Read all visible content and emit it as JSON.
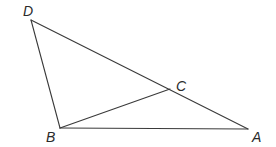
{
  "diagram": {
    "type": "geometry-triangle",
    "stroke_color": "#3a3a3a",
    "label_color": "#2a2a2a",
    "points": {
      "D": {
        "x": 31,
        "y": 20,
        "label": "D",
        "label_x": 23,
        "label_y": 16
      },
      "B": {
        "x": 60,
        "y": 128,
        "label": "B",
        "label_x": 46,
        "label_y": 142
      },
      "C": {
        "x": 170,
        "y": 89,
        "label": "C",
        "label_x": 176,
        "label_y": 91
      },
      "A": {
        "x": 248,
        "y": 129,
        "label": "A",
        "label_x": 252,
        "label_y": 142
      }
    },
    "segments": [
      {
        "from": "D",
        "to": "A",
        "name": "segment-da"
      },
      {
        "from": "D",
        "to": "B",
        "name": "segment-db"
      },
      {
        "from": "B",
        "to": "A",
        "name": "segment-ba"
      },
      {
        "from": "B",
        "to": "C",
        "name": "segment-bc"
      }
    ]
  }
}
